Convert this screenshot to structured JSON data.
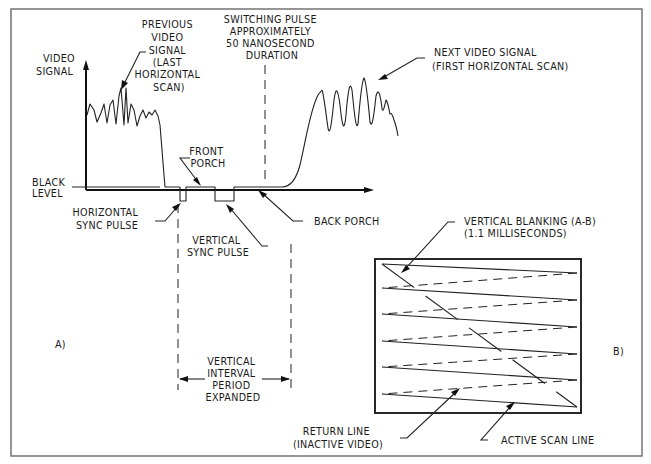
{
  "diagram": {
    "type": "video-signal-timing-diagram",
    "panels": {
      "a": {
        "label": "A)"
      },
      "b": {
        "label": "B)"
      }
    },
    "axis": {
      "y_label_line1": "VIDEO",
      "y_label_line2": "SIGNAL",
      "black_level_line1": "BLACK",
      "black_level_line2": "LEVEL"
    },
    "labels": {
      "previous_signal": [
        "PREVIOUS",
        "VIDEO",
        "SIGNAL",
        "(LAST",
        "HORIZONTAL",
        "SCAN)"
      ],
      "switching_pulse": [
        "SWITCHING PULSE",
        "APPROXIMATELY",
        "50 NANOSECOND",
        "DURATION"
      ],
      "next_signal": [
        "NEXT VIDEO SIGNAL",
        "(FIRST HORIZONTAL SCAN)"
      ],
      "front_porch": [
        "FRONT",
        "PORCH"
      ],
      "horizontal_sync": [
        "HORIZONTAL",
        "SYNC PULSE"
      ],
      "vertical_sync": [
        "VERTICAL",
        "SYNC PULSE"
      ],
      "back_porch": "BACK PORCH",
      "vertical_interval": [
        "VERTICAL",
        "INTERVAL",
        "PERIOD",
        "EXPANDED"
      ],
      "vertical_blanking": [
        "VERTICAL BLANKING (A-B)",
        "(1.1 MILLISECONDS)"
      ],
      "return_line": [
        "RETURN LINE",
        "(INACTIVE VIDEO)"
      ],
      "active_scan_line": "ACTIVE SCAN LINE"
    }
  }
}
